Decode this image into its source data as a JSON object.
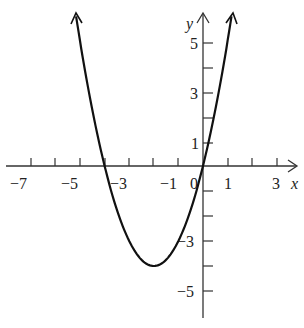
{
  "chart_data": {
    "type": "line",
    "title": "",
    "xlabel": "x",
    "ylabel": "y",
    "function": "y = x^2 + 4x",
    "vertex": [
      -2,
      -4
    ],
    "x_intercepts": [
      -4,
      0
    ],
    "xlim": [
      -8,
      4
    ],
    "ylim": [
      -6,
      6
    ],
    "grid": false,
    "x_tick_labels": [
      "-7",
      "-5",
      "-3",
      "-1",
      "0",
      "1",
      "3"
    ],
    "y_tick_labels": [
      "5",
      "3",
      "1",
      "-3",
      "-5"
    ],
    "x": [
      -5.16,
      -5,
      -4.5,
      -4,
      -3.5,
      -3,
      -2.5,
      -2,
      -1.5,
      -1,
      -0.5,
      0,
      0.5,
      1,
      1.16
    ],
    "values": [
      6,
      5,
      2.25,
      0,
      -1.75,
      -3,
      -3.75,
      -4,
      -3.75,
      -3,
      -1.75,
      0,
      2.25,
      5,
      6
    ]
  },
  "labels": {
    "x_axis": "x",
    "y_axis": "y",
    "xt_m7": "−7",
    "xt_m5": "−5",
    "xt_m3": "−3",
    "xt_m1": "−1",
    "xt_0": "0",
    "xt_1": "1",
    "xt_3": "3",
    "yt_5": "5",
    "yt_3": "3",
    "yt_1": "1",
    "yt_m3": "−3",
    "yt_m5": "−5"
  }
}
